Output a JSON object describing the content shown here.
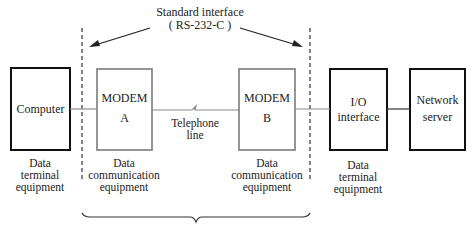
{
  "title": {
    "line1": "Standard interface",
    "line2": "( RS-232-C )"
  },
  "nodes": [
    {
      "id": "computer",
      "label_line1": "Computer",
      "label_line2": "",
      "caption": [
        "Data",
        "terminal",
        "equipment"
      ],
      "border": "#111111"
    },
    {
      "id": "modem_a",
      "label_line1": "MODEM",
      "label_line2": "A",
      "caption": [
        "Data",
        "communication",
        "equipment"
      ],
      "border": "#8a8a8a"
    },
    {
      "id": "modem_b",
      "label_line1": "MODEM",
      "label_line2": "B",
      "caption": [
        "Data",
        "communication",
        "equipment"
      ],
      "border": "#8a8a8a"
    },
    {
      "id": "io_interface",
      "label_line1": "I/O",
      "label_line2": "interface",
      "caption": [
        "Data",
        "terminal",
        "equipment"
      ],
      "border": "#111111"
    },
    {
      "id": "network_server",
      "label_line1": "Network",
      "label_line2": "server",
      "caption": [],
      "border": "#111111"
    }
  ],
  "link": {
    "line1": "Telephone",
    "line2": "line"
  },
  "colors": {
    "terminal_border": "#111111",
    "modem_border": "#8a8a8a",
    "line": "#8a8a8a",
    "text": "#222222"
  }
}
